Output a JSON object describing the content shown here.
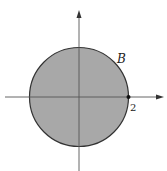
{
  "diagram": {
    "region_label": "B",
    "point_label": "2",
    "colors": {
      "fill": "#a8a8a8",
      "stroke": "#333333",
      "axis": "#555555"
    }
  }
}
